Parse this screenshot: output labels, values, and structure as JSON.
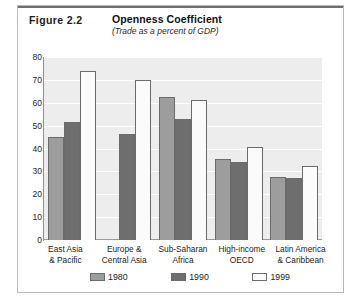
{
  "figure": {
    "number": "Figure 2.2",
    "title": "Openness Coefficient",
    "subtitle": "(Trade as a percent of GDP)"
  },
  "chart_data": {
    "type": "bar",
    "title": "Openness Coefficient",
    "subtitle": "(Trade as a percent of GDP)",
    "xlabel": "",
    "ylabel": "",
    "ylim": [
      0,
      80
    ],
    "yticks": [
      0,
      10,
      20,
      30,
      40,
      50,
      60,
      70,
      80
    ],
    "grid": true,
    "legend_position": "bottom",
    "categories": [
      "East Asia\n& Pacific",
      "Europe &\nCentral Asia",
      "Sub-Saharan\nAfrica",
      "High-income\nOECD",
      "Latin America\n& Caribbean"
    ],
    "category_lines": [
      [
        "East Asia",
        "& Pacific"
      ],
      [
        "Europe &",
        "Central Asia"
      ],
      [
        "Sub-Saharan",
        "Africa"
      ],
      [
        "High-income",
        "OECD"
      ],
      [
        "Latin America",
        "& Caribbean"
      ]
    ],
    "series": [
      {
        "name": "1980",
        "color": "#9d9d9d",
        "values": [
          45,
          null,
          62.5,
          35.5,
          27.5
        ]
      },
      {
        "name": "1990",
        "color": "#6e6e6e",
        "values": [
          51.5,
          46.5,
          53,
          34,
          27
        ]
      },
      {
        "name": "1999",
        "color": "#fbfbfb",
        "values": [
          74,
          70,
          61,
          40.5,
          32.5
        ]
      }
    ]
  },
  "legend": [
    {
      "label": "1980",
      "swatch": "s0"
    },
    {
      "label": "1990",
      "swatch": "s1"
    },
    {
      "label": "1999",
      "swatch": "s2"
    }
  ]
}
